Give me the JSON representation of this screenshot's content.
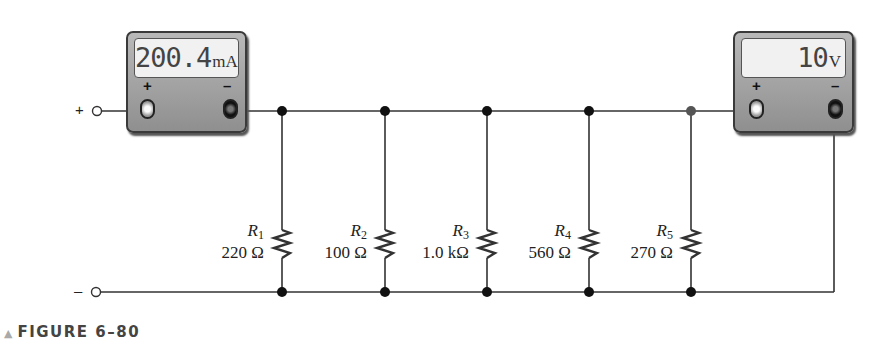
{
  "figure": {
    "caption_label": "FIGURE 6–80",
    "caption_marker": "▲"
  },
  "terminals": {
    "positive_label": "+",
    "negative_label": "–"
  },
  "ammeter": {
    "reading": "200.4",
    "unit": "mA",
    "pos_sign": "+",
    "neg_sign": "–"
  },
  "voltmeter": {
    "reading": "10",
    "unit": "V",
    "pos_sign": "+",
    "neg_sign": "–"
  },
  "resistors": [
    {
      "name": "R",
      "sub": "1",
      "value": "220 Ω"
    },
    {
      "name": "R",
      "sub": "2",
      "value": "100 Ω"
    },
    {
      "name": "R",
      "sub": "3",
      "value": "1.0 kΩ"
    },
    {
      "name": "R",
      "sub": "4",
      "value": "560 Ω"
    },
    {
      "name": "R",
      "sub": "5",
      "value": "270 Ω"
    }
  ],
  "colors": {
    "wire": "#333333",
    "meter_body": "#a8a8a8",
    "display_bg": "#f1f1f1"
  }
}
